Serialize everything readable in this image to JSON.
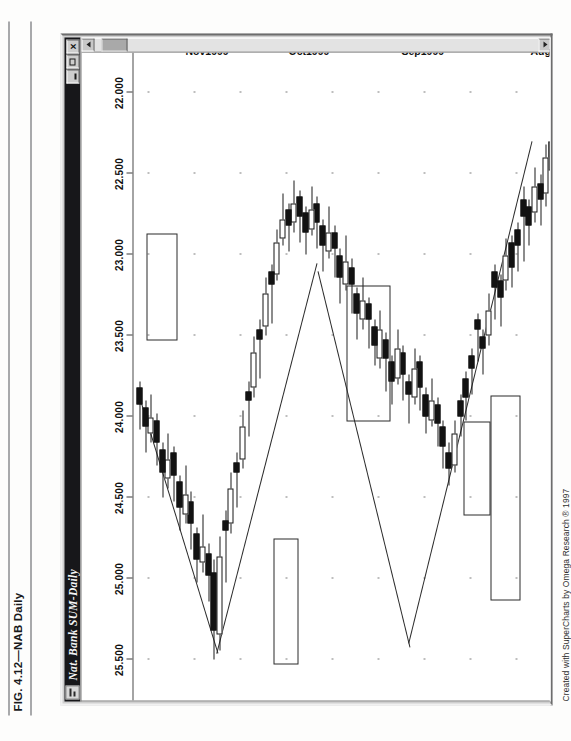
{
  "figure": {
    "caption": "FIG. 4.12—NAB Daily"
  },
  "window": {
    "title": "Nat. Bank  SUM-Daily",
    "icon": "chart-window-icon",
    "buttons": [
      {
        "name": "minimize-button",
        "glyph": ""
      },
      {
        "name": "maximize-button",
        "glyph": ""
      },
      {
        "name": "close-button",
        "glyph": "×"
      }
    ]
  },
  "scrollbar": {
    "up_arrow": "scroll-up-arrow",
    "down_arrow": "scroll-down-arrow",
    "thumb": "scroll-thumb"
  },
  "credit": "Created with SuperCharts by Omega Research ® 1997",
  "chart_data": {
    "type": "candlestick",
    "title": "Nat. Bank  SUM-Daily",
    "xlabel": "",
    "ylabel": "",
    "ylim": [
      21.75,
      25.75
    ],
    "grid": true,
    "legend": "none",
    "orientation": "rotated-90ccw",
    "price_ticks": [
      "25.500",
      "25.000",
      "24.500",
      "24.000",
      "23.500",
      "23.000",
      "22.500",
      "22.000"
    ],
    "price_tick_values": [
      25.5,
      25.0,
      24.5,
      24.0,
      23.5,
      23.0,
      22.5,
      22.0
    ],
    "date_ticks": [
      "Aug1!",
      "Sep1999",
      "Oct1999",
      "Nov1999"
    ],
    "date_tick_positions": [
      0.045,
      0.355,
      0.625,
      0.87
    ],
    "annotations": [
      {
        "name": "pattern-box-august",
        "note": "highlighted reversal pattern near Aug1!"
      },
      {
        "name": "pattern-box-september",
        "note": "highlighted pattern at Sep1999 high"
      },
      {
        "name": "pattern-box-october",
        "note": "highlighted doji cluster in Oct1999"
      },
      {
        "name": "pattern-box-november-1",
        "note": "highlighted long black candle pair"
      },
      {
        "name": "pattern-box-november-2",
        "note": "highlighted top pattern near Nov1999"
      }
    ],
    "series": [
      {
        "name": "Trendline A",
        "type": "line",
        "note": "rising support line from Aug low to Sep high"
      },
      {
        "name": "Trendline B",
        "type": "line",
        "note": "falling resistance line from Sep high into Oct"
      },
      {
        "name": "Trendline C",
        "type": "line",
        "note": "rising line from Oct low to Nov high"
      },
      {
        "name": "Trendline D",
        "type": "line",
        "note": "falling line from Nov high"
      }
    ],
    "candles": [
      {
        "i": 0,
        "o": 22.48,
        "h": 22.62,
        "l": 22.26,
        "c": 22.3,
        "dir": "down"
      },
      {
        "i": 1,
        "o": 22.4,
        "h": 22.7,
        "l": 22.32,
        "c": 22.62,
        "dir": "up"
      },
      {
        "i": 2,
        "o": 22.66,
        "h": 22.82,
        "l": 22.5,
        "c": 22.56,
        "dir": "down"
      },
      {
        "i": 3,
        "o": 22.58,
        "h": 22.8,
        "l": 22.46,
        "c": 22.74,
        "dir": "up"
      },
      {
        "i": 4,
        "o": 22.82,
        "h": 22.94,
        "l": 22.66,
        "c": 22.7,
        "dir": "down"
      },
      {
        "i": 5,
        "o": 22.76,
        "h": 23.04,
        "l": 22.58,
        "c": 22.66,
        "dir": "down"
      },
      {
        "i": 6,
        "o": 22.94,
        "h": 23.1,
        "l": 22.8,
        "c": 22.84,
        "dir": "down"
      },
      {
        "i": 7,
        "o": 23.08,
        "h": 23.2,
        "l": 22.88,
        "c": 22.92,
        "dir": "down"
      },
      {
        "i": 8,
        "o": 23.0,
        "h": 23.22,
        "l": 22.9,
        "c": 23.16,
        "dir": "up"
      },
      {
        "i": 9,
        "o": 23.26,
        "h": 23.44,
        "l": 23.12,
        "c": 23.16,
        "dir": "down"
      },
      {
        "i": 10,
        "o": 23.2,
        "h": 23.4,
        "l": 23.06,
        "c": 23.1,
        "dir": "down"
      },
      {
        "i": 11,
        "o": 23.34,
        "h": 23.56,
        "l": 23.24,
        "c": 23.5,
        "dir": "up"
      },
      {
        "i": 12,
        "o": 23.58,
        "h": 23.74,
        "l": 23.46,
        "c": 23.5,
        "dir": "down"
      },
      {
        "i": 13,
        "o": 23.46,
        "h": 23.66,
        "l": 23.36,
        "c": 23.4,
        "dir": "down"
      },
      {
        "i": 14,
        "o": 23.7,
        "h": 23.86,
        "l": 23.58,
        "c": 23.62,
        "dir": "down"
      },
      {
        "i": 15,
        "o": 23.88,
        "h": 24.02,
        "l": 23.72,
        "c": 23.76,
        "dir": "down"
      },
      {
        "i": 16,
        "o": 24.0,
        "h": 24.12,
        "l": 23.86,
        "c": 23.9,
        "dir": "down"
      },
      {
        "i": 17,
        "o": 24.1,
        "h": 24.34,
        "l": 24.02,
        "c": 24.3,
        "dir": "up"
      },
      {
        "i": 18,
        "o": 24.32,
        "h": 24.42,
        "l": 24.16,
        "c": 24.22,
        "dir": "down"
      },
      {
        "i": 19,
        "o": 24.18,
        "h": 24.32,
        "l": 24.02,
        "c": 24.06,
        "dir": "down"
      },
      {
        "i": 20,
        "o": 24.04,
        "h": 24.18,
        "l": 23.88,
        "c": 23.92,
        "dir": "down"
      },
      {
        "i": 21,
        "o": 23.9,
        "h": 24.06,
        "l": 23.76,
        "c": 24.02,
        "dir": "up"
      },
      {
        "i": 22,
        "o": 24.0,
        "h": 24.1,
        "l": 23.82,
        "c": 23.86,
        "dir": "down"
      },
      {
        "i": 23,
        "o": 23.82,
        "h": 23.96,
        "l": 23.62,
        "c": 23.66,
        "dir": "down"
      },
      {
        "i": 24,
        "o": 23.7,
        "h": 23.92,
        "l": 23.58,
        "c": 23.88,
        "dir": "up"
      },
      {
        "i": 25,
        "o": 23.86,
        "h": 24.04,
        "l": 23.74,
        "c": 23.78,
        "dir": "down"
      },
      {
        "i": 26,
        "o": 23.74,
        "h": 23.9,
        "l": 23.56,
        "c": 23.6,
        "dir": "down"
      },
      {
        "i": 27,
        "o": 23.58,
        "h": 23.8,
        "l": 23.46,
        "c": 23.76,
        "dir": "up"
      },
      {
        "i": 28,
        "o": 23.78,
        "h": 23.92,
        "l": 23.62,
        "c": 23.66,
        "dir": "down"
      },
      {
        "i": 29,
        "o": 23.64,
        "h": 23.84,
        "l": 23.48,
        "c": 23.52,
        "dir": "down"
      },
      {
        "i": 30,
        "o": 23.46,
        "h": 23.7,
        "l": 23.34,
        "c": 23.64,
        "dir": "up"
      },
      {
        "i": 31,
        "o": 23.56,
        "h": 23.68,
        "l": 23.4,
        "c": 23.44,
        "dir": "down"
      },
      {
        "i": 32,
        "o": 23.4,
        "h": 23.58,
        "l": 23.26,
        "c": 23.3,
        "dir": "down"
      },
      {
        "i": 33,
        "o": 23.28,
        "h": 23.46,
        "l": 23.14,
        "c": 23.4,
        "dir": "up"
      },
      {
        "i": 34,
        "o": 23.36,
        "h": 23.52,
        "l": 23.2,
        "c": 23.24,
        "dir": "down"
      },
      {
        "i": 35,
        "o": 23.18,
        "h": 23.36,
        "l": 23.02,
        "c": 23.08,
        "dir": "down"
      },
      {
        "i": 36,
        "o": 23.04,
        "h": 23.22,
        "l": 22.88,
        "c": 23.18,
        "dir": "up"
      },
      {
        "i": 37,
        "o": 23.14,
        "h": 23.3,
        "l": 22.96,
        "c": 23.0,
        "dir": "down"
      },
      {
        "i": 38,
        "o": 22.96,
        "h": 23.14,
        "l": 22.82,
        "c": 22.86,
        "dir": "down"
      },
      {
        "i": 39,
        "o": 22.86,
        "h": 23.02,
        "l": 22.7,
        "c": 22.98,
        "dir": "up"
      },
      {
        "i": 40,
        "o": 22.94,
        "h": 23.1,
        "l": 22.78,
        "c": 22.82,
        "dir": "down"
      },
      {
        "i": 41,
        "o": 22.8,
        "h": 22.96,
        "l": 22.64,
        "c": 22.68,
        "dir": "down"
      },
      {
        "i": 42,
        "o": 22.72,
        "h": 22.88,
        "l": 22.58,
        "c": 22.84,
        "dir": "up"
      },
      {
        "i": 43,
        "o": 22.86,
        "h": 23.0,
        "l": 22.7,
        "c": 22.74,
        "dir": "down"
      },
      {
        "i": 44,
        "o": 22.76,
        "h": 22.92,
        "l": 22.6,
        "c": 22.64,
        "dir": "down"
      },
      {
        "i": 45,
        "o": 22.68,
        "h": 22.86,
        "l": 22.54,
        "c": 22.8,
        "dir": "up"
      },
      {
        "i": 46,
        "o": 22.82,
        "h": 22.98,
        "l": 22.68,
        "c": 22.72,
        "dir": "down"
      },
      {
        "i": 47,
        "o": 22.78,
        "h": 22.94,
        "l": 22.62,
        "c": 22.9,
        "dir": "up"
      },
      {
        "i": 48,
        "o": 22.92,
        "h": 23.16,
        "l": 22.84,
        "c": 23.12,
        "dir": "up"
      },
      {
        "i": 49,
        "o": 23.18,
        "h": 23.42,
        "l": 23.06,
        "c": 23.1,
        "dir": "down"
      },
      {
        "i": 50,
        "o": 23.24,
        "h": 23.5,
        "l": 23.14,
        "c": 23.44,
        "dir": "up"
      },
      {
        "i": 51,
        "o": 23.52,
        "h": 23.76,
        "l": 23.4,
        "c": 23.46,
        "dir": "down"
      },
      {
        "i": 52,
        "o": 23.6,
        "h": 23.88,
        "l": 23.5,
        "c": 23.82,
        "dir": "up"
      },
      {
        "i": 53,
        "o": 23.9,
        "h": 24.12,
        "l": 23.78,
        "c": 23.84,
        "dir": "down"
      },
      {
        "i": 54,
        "o": 24.06,
        "h": 24.32,
        "l": 23.96,
        "c": 24.26,
        "dir": "up"
      },
      {
        "i": 55,
        "o": 24.34,
        "h": 24.56,
        "l": 24.22,
        "c": 24.28,
        "dir": "down"
      },
      {
        "i": 56,
        "o": 24.44,
        "h": 24.72,
        "l": 24.34,
        "c": 24.66,
        "dir": "up"
      },
      {
        "i": 57,
        "o": 24.7,
        "h": 25.02,
        "l": 24.58,
        "c": 24.64,
        "dir": "down"
      },
      {
        "i": 58,
        "o": 24.86,
        "h": 25.44,
        "l": 24.74,
        "c": 25.34,
        "dir": "up"
      },
      {
        "i": 59,
        "o": 25.32,
        "h": 25.5,
        "l": 24.88,
        "c": 24.96,
        "dir": "down"
      },
      {
        "i": 60,
        "o": 24.98,
        "h": 25.14,
        "l": 24.78,
        "c": 24.84,
        "dir": "down"
      },
      {
        "i": 61,
        "o": 24.8,
        "h": 24.96,
        "l": 24.6,
        "c": 24.9,
        "dir": "up"
      },
      {
        "i": 62,
        "o": 24.88,
        "h": 25.02,
        "l": 24.68,
        "c": 24.72,
        "dir": "down"
      },
      {
        "i": 63,
        "o": 24.66,
        "h": 24.82,
        "l": 24.46,
        "c": 24.52,
        "dir": "down"
      },
      {
        "i": 64,
        "o": 24.48,
        "h": 24.66,
        "l": 24.3,
        "c": 24.6,
        "dir": "up"
      },
      {
        "i": 65,
        "o": 24.56,
        "h": 24.7,
        "l": 24.36,
        "c": 24.4,
        "dir": "down"
      },
      {
        "i": 66,
        "o": 24.36,
        "h": 24.52,
        "l": 24.18,
        "c": 24.22,
        "dir": "down"
      },
      {
        "i": 67,
        "o": 24.26,
        "h": 24.44,
        "l": 24.1,
        "c": 24.38,
        "dir": "up"
      },
      {
        "i": 68,
        "o": 24.34,
        "h": 24.5,
        "l": 24.16,
        "c": 24.2,
        "dir": "down"
      },
      {
        "i": 69,
        "o": 24.16,
        "h": 24.3,
        "l": 23.98,
        "c": 24.02,
        "dir": "down"
      },
      {
        "i": 70,
        "o": 24.0,
        "h": 24.16,
        "l": 23.86,
        "c": 24.1,
        "dir": "up"
      },
      {
        "i": 71,
        "o": 24.06,
        "h": 24.22,
        "l": 23.9,
        "c": 23.94,
        "dir": "down"
      },
      {
        "i": 72,
        "o": 23.92,
        "h": 24.08,
        "l": 23.78,
        "c": 23.82,
        "dir": "down"
      }
    ]
  }
}
